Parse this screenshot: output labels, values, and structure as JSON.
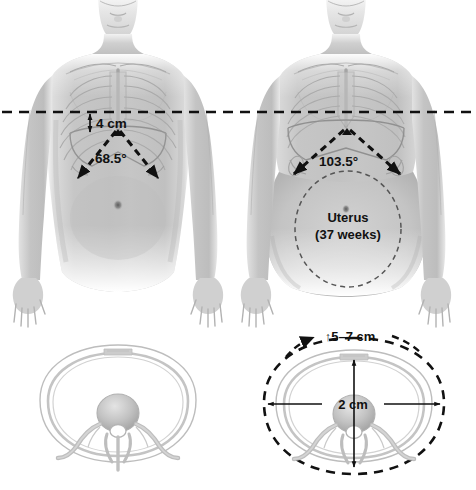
{
  "figure": {
    "background_color": "#ffffff",
    "skin_color": "#c9c9c9",
    "skin_shadow_color": "#a8a8a8",
    "bone_color": "#b4b4b4",
    "annotation_color": "#111111",
    "dashed_outline_color": "#555555"
  },
  "reference_line": {
    "name": "horizontal-reference-line",
    "style": "dashed",
    "color": "#111111"
  },
  "panels": {
    "nonpregnant_body": {
      "name": "nonpregnant-anterior-view",
      "annotations": {
        "diaphragm_rise": {
          "label": "4 cm",
          "arrow": "double-vertical"
        },
        "subcostal_angle": {
          "label": "68.5°",
          "arrow": "angle-wedge"
        }
      }
    },
    "pregnant_body": {
      "name": "pregnant-anterior-view",
      "annotations": {
        "subcostal_angle": {
          "label": "103.5°",
          "arrow": "angle-wedge"
        },
        "uterus": {
          "label_line1": "Uterus",
          "label_line2": "(37 weeks)"
        }
      }
    },
    "nonpregnant_cross_section": {
      "name": "nonpregnant-thorax-cross-section",
      "annotations": {}
    },
    "pregnant_cross_section": {
      "name": "pregnant-thorax-cross-section",
      "annotations": {
        "circumference_increase": {
          "label": "↑5–7 cm",
          "arrow": "single-right"
        },
        "ap_diameter": {
          "label": "2 cm",
          "arrow": "double-horizontal"
        },
        "vertical_expansion": {
          "label": "",
          "arrow": "double-vertical"
        }
      }
    }
  }
}
